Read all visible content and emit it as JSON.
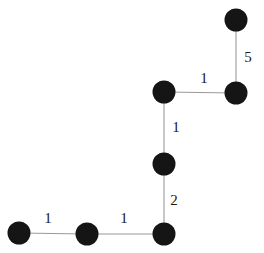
{
  "figure": {
    "width": 264,
    "height": 253,
    "background_color": "#ffffff",
    "node_color": "#151515",
    "edge_color": "#9a9a9a",
    "label_color": "#1a1a1a",
    "node_radius": 11.5
  },
  "chart_data": {
    "type": "diagram",
    "diagram_kind": "weighted-path-graph",
    "title": "",
    "xlabel": "",
    "ylabel": "",
    "grid": false,
    "legend": false,
    "nodes": [
      {
        "id": "n1",
        "label": "",
        "x": 19,
        "y": 233
      },
      {
        "id": "n2",
        "label": "",
        "x": 87,
        "y": 234
      },
      {
        "id": "n3",
        "label": "",
        "x": 164,
        "y": 234
      },
      {
        "id": "n4",
        "label": "",
        "x": 164,
        "y": 164
      },
      {
        "id": "n5",
        "label": "",
        "x": 164,
        "y": 92
      },
      {
        "id": "n6",
        "label": "",
        "x": 236,
        "y": 93
      },
      {
        "id": "n7",
        "label": "",
        "x": 236,
        "y": 20
      }
    ],
    "edges": [
      {
        "id": "e1",
        "source": "n1",
        "target": "n2",
        "weight": "1",
        "label_x": 48,
        "label_y": 218
      },
      {
        "id": "e2",
        "source": "n2",
        "target": "n3",
        "weight": "1",
        "label_x": 124,
        "label_y": 218
      },
      {
        "id": "e3",
        "source": "n3",
        "target": "n4",
        "weight": "2",
        "label_x": 174,
        "label_y": 200
      },
      {
        "id": "e4",
        "source": "n4",
        "target": "n5",
        "weight": "1",
        "label_x": 176,
        "label_y": 127
      },
      {
        "id": "e5",
        "source": "n5",
        "target": "n6",
        "weight": "1",
        "label_x": 204,
        "label_y": 78
      },
      {
        "id": "e6",
        "source": "n6",
        "target": "n7",
        "weight": "5",
        "label_x": 248,
        "label_y": 57
      }
    ],
    "weights": [
      "1",
      "1",
      "2",
      "1",
      "1",
      "5"
    ]
  }
}
